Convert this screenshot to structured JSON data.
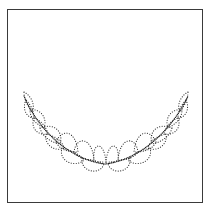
{
  "figure": {
    "frame_color": "#3a3a3a",
    "stroke_color": "#2a2a2a",
    "background": "#ffffff"
  }
}
